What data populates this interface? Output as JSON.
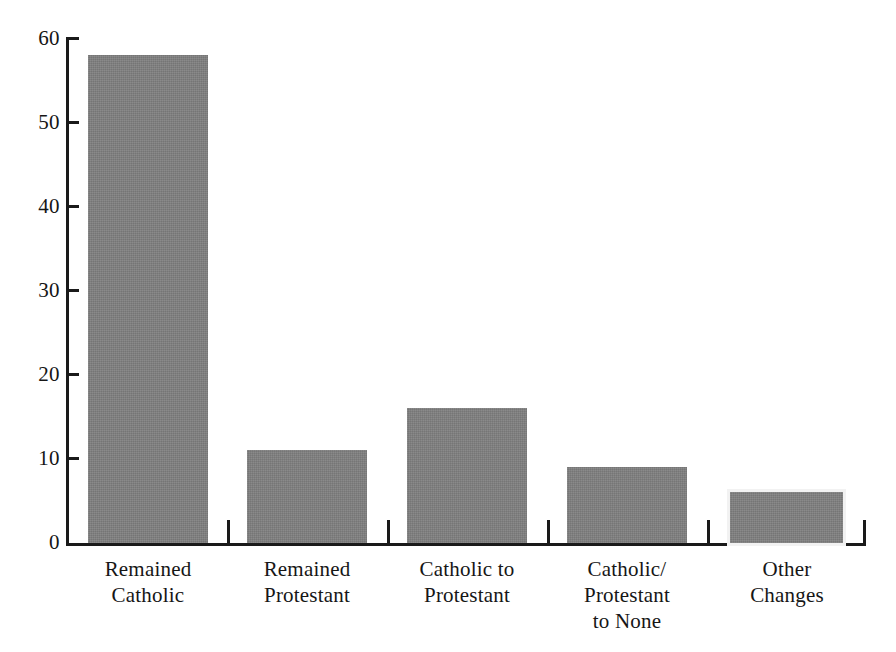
{
  "chart_data": {
    "type": "bar",
    "title": "",
    "subtitle": "",
    "xlabel": "",
    "ylabel": "",
    "categories": [
      "Remained Catholic",
      "Remained Protestant",
      "Catholic to Protestant",
      "Catholic/ Protestant to None",
      "Other Changes"
    ],
    "category_lines": [
      [
        "Remained",
        "Catholic"
      ],
      [
        "Remained",
        "Protestant"
      ],
      [
        "Catholic to",
        "Protestant"
      ],
      [
        "Catholic/",
        "Protestant",
        "to None"
      ],
      [
        "Other",
        "Changes"
      ]
    ],
    "values": [
      58,
      11,
      16,
      9,
      6
    ],
    "ylim": [
      0,
      60
    ],
    "ytick_labels": [
      "0",
      "10",
      "20",
      "30",
      "40",
      "50",
      "60"
    ],
    "ytick_values": [
      0,
      10,
      20,
      30,
      40,
      50,
      60
    ],
    "grid": false,
    "legend": false,
    "legend_position": "none",
    "bar_color": "#808080",
    "axis_color": "#1a1a1a",
    "background_color": "#ffffff"
  }
}
